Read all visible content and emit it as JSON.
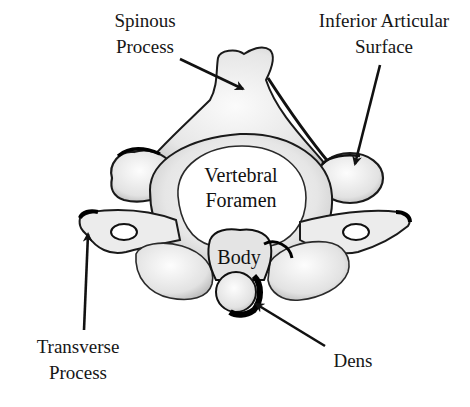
{
  "diagram": {
    "labels": {
      "spinous_process": {
        "line1": "Spinous",
        "line2": "Process"
      },
      "inferior_articular_surface": {
        "line1": "Inferior Articular",
        "line2": "Surface"
      },
      "transverse_process": {
        "line1": "Transverse",
        "line2": "Process"
      },
      "dens": {
        "line1": "Dens"
      },
      "vertebral_foramen": {
        "line1": "Vertebral",
        "line2": "Foramen"
      },
      "body": {
        "line1": "Body"
      }
    },
    "colors": {
      "background": "#ffffff",
      "bone_fill": "#f4f4f4",
      "bone_shade": "#cfcfcf",
      "outline": "#111111",
      "arrow": "#111111",
      "text": "#161616"
    }
  }
}
